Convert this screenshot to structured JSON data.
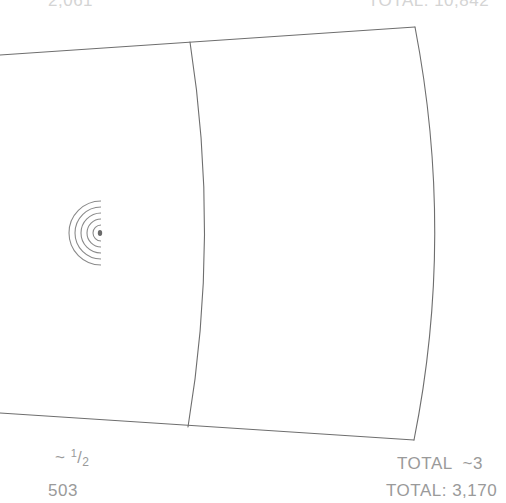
{
  "diagram": {
    "type": "curved-panel-schematic",
    "stroke_color": "#6e6e6e",
    "text_color": "#9a9a9a",
    "faded_text_color": "#d4d4d4",
    "regions": [
      {
        "name": "left-panel",
        "contains": "concentric-semicircle-emitter"
      },
      {
        "name": "right-panel",
        "contains": "empty"
      }
    ],
    "emitter": {
      "rings": 5,
      "has_center_dot": true
    }
  },
  "labels": {
    "top_left": "2,061",
    "top_right": "TOTAL: 10,842",
    "bottom_left_prefix": "~",
    "bottom_left_fraction": {
      "numerator": "1",
      "denominator": "2"
    },
    "bottom_left_count": "503",
    "bottom_right_total": "TOTAL  ~3",
    "bottom_right_total_value": "TOTAL: 3,170"
  }
}
